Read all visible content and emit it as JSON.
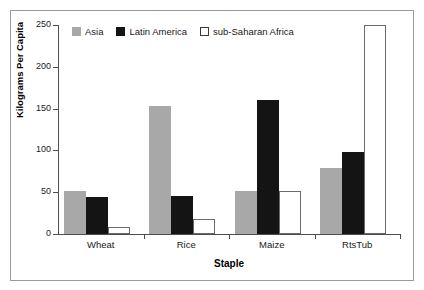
{
  "chart_data": {
    "type": "bar",
    "title": "",
    "xlabel": "Staple",
    "ylabel": "Kilograms Per Capita",
    "categories": [
      "Wheat",
      "Rice",
      "Maize",
      "RtsTub"
    ],
    "series": [
      {
        "name": "Asia",
        "color": "#a8a8a8",
        "values": [
          51,
          153,
          51,
          79
        ]
      },
      {
        "name": "Latin America",
        "color": "#141414",
        "values": [
          44,
          45,
          160,
          98
        ]
      },
      {
        "name": "sub-Saharan Africa",
        "color": "#ffffff",
        "values": [
          8,
          18,
          52,
          250
        ]
      }
    ],
    "ylim": [
      0,
      250
    ],
    "yticks": [
      0,
      50,
      100,
      150,
      200,
      250
    ],
    "ytick_labels": [
      "0",
      "50",
      "100",
      "150",
      "200",
      "250"
    ],
    "grid": false,
    "legend_position": "top-left-inside"
  },
  "legend": {
    "items": [
      {
        "label": "Asia",
        "swatch": "asia"
      },
      {
        "label": "Latin America",
        "swatch": "latin"
      },
      {
        "label": "sub-Saharan Africa",
        "swatch": "africa"
      }
    ]
  },
  "axes": {
    "y_title": "Kilograms Per Capita",
    "x_title": "Staple"
  }
}
